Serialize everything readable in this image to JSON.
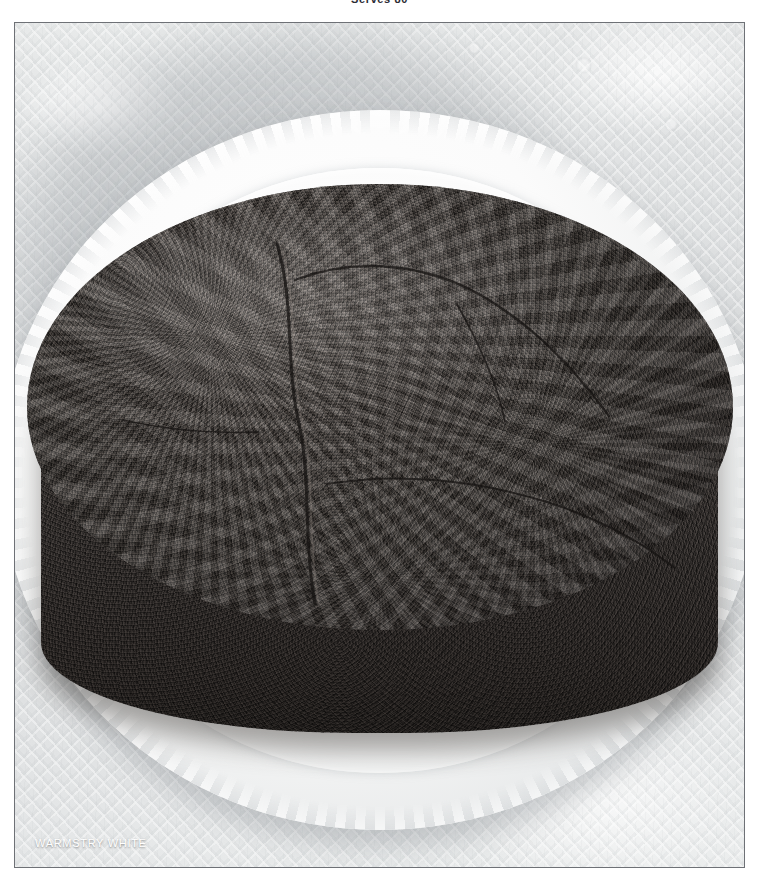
{
  "page": {
    "header_text": "Serves 80",
    "background_color": "#ffffff"
  },
  "photo": {
    "caption": "WARMSTRY WHITE",
    "caption_color": "#ffffff",
    "border_color": "#6e7176",
    "subject": "round dark fruit cake on white fluted plate",
    "elements": {
      "cake_label": "dark crumb-topped round cake",
      "cake_color": "#443f3b",
      "plate_label": "white fluted ceramic plate",
      "plate_color": "#f7f8f8",
      "cloth_label": "white lace tablecloth",
      "cloth_color": "#e2e4e5"
    }
  }
}
